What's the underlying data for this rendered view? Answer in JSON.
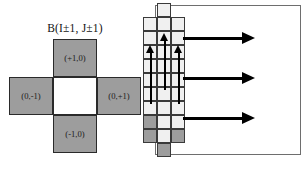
{
  "figure": {
    "background_color": "#ffffff",
    "stencil_fill_color": "#9d9d9d",
    "center_fill_color": "#ffffff",
    "outline_color": "#2a2a2a",
    "arrow_color": "#000000",
    "domain_border_color": "#6e6e6e"
  },
  "left_panel": {
    "title": "B(I±1, J±1)",
    "cells": {
      "north": {
        "label": "(+1,0)",
        "fill": "gray"
      },
      "west": {
        "label": "(0,-1)",
        "fill": "gray"
      },
      "center": {
        "label": "",
        "fill": "white"
      },
      "east": {
        "label": "(0,+1)",
        "fill": "gray"
      },
      "south": {
        "label": "(-1,0)",
        "fill": "gray"
      }
    }
  },
  "right_panel": {
    "domain_label": "",
    "grid": {
      "columns": 3,
      "rows": 11,
      "cell_shades": [
        [
          "none",
          "light",
          "none"
        ],
        [
          "light",
          "light",
          "light"
        ],
        [
          "light",
          "light",
          "light"
        ],
        [
          "light",
          "light",
          "light"
        ],
        [
          "light",
          "light",
          "light"
        ],
        [
          "light",
          "light",
          "light"
        ],
        [
          "light",
          "light",
          "light"
        ],
        [
          "light",
          "light",
          "light"
        ],
        [
          "dark",
          "light",
          "light"
        ],
        [
          "dark",
          "light",
          "dark"
        ],
        [
          "none",
          "dark",
          "none"
        ]
      ]
    },
    "vertical_arrows": [
      {
        "column": 0,
        "label": "up-arrow-col-0"
      },
      {
        "column": 1,
        "label": "up-arrow-col-1"
      },
      {
        "column": 2,
        "label": "up-arrow-col-2"
      }
    ],
    "horizontal_arrows": [
      {
        "label": "flow-arrow-top"
      },
      {
        "label": "flow-arrow-middle"
      },
      {
        "label": "flow-arrow-bottom"
      }
    ]
  }
}
